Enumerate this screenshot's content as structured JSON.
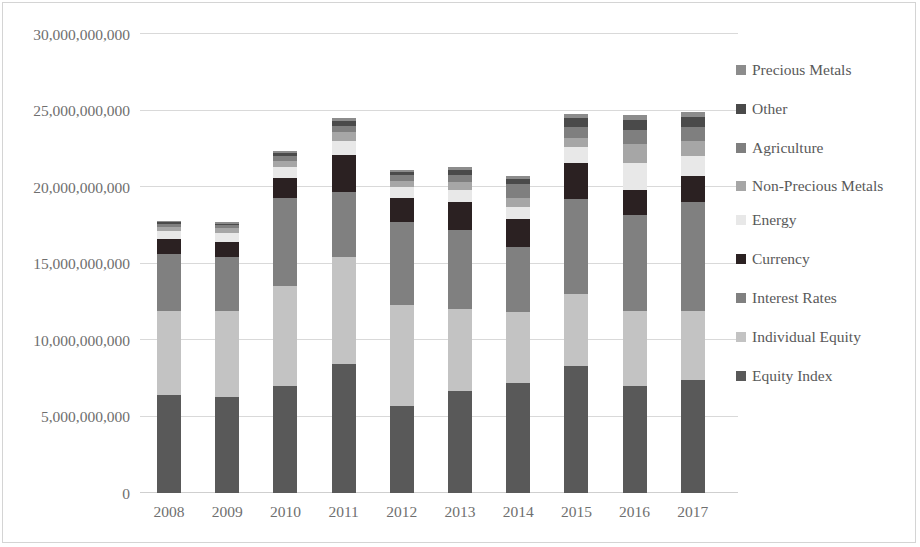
{
  "chart_data": {
    "type": "bar",
    "stacked": true,
    "title": "",
    "xlabel": "",
    "ylabel": "",
    "ylim": [
      0,
      30000000000
    ],
    "grid": true,
    "legend_position": "right",
    "categories": [
      "2008",
      "2009",
      "2010",
      "2011",
      "2012",
      "2013",
      "2014",
      "2015",
      "2016",
      "2017"
    ],
    "y_ticks": [
      0,
      5000000000,
      10000000000,
      15000000000,
      20000000000,
      25000000000,
      30000000000
    ],
    "y_tick_labels": [
      "0",
      "5,000,000,000",
      "10,000,000,000",
      "15,000,000,000",
      "20,000,000,000",
      "25,000,000,000",
      "30,000,000,000"
    ],
    "series": [
      {
        "name": "Equity Index",
        "color": "#595959",
        "values": [
          6400000000,
          6300000000,
          7000000000,
          8400000000,
          5700000000,
          6700000000,
          7200000000,
          8300000000,
          7000000000,
          7400000000
        ]
      },
      {
        "name": "Individual Equity",
        "color": "#c3c3c3",
        "values": [
          5500000000,
          5600000000,
          6500000000,
          7000000000,
          6600000000,
          5300000000,
          4600000000,
          4700000000,
          4900000000,
          4500000000
        ]
      },
      {
        "name": "Interest Rates",
        "color": "#808080",
        "values": [
          3700000000,
          3500000000,
          5800000000,
          4300000000,
          5400000000,
          5200000000,
          4300000000,
          6200000000,
          6300000000,
          7100000000
        ]
      },
      {
        "name": "Currency",
        "color": "#2b2122",
        "values": [
          1000000000,
          1000000000,
          1300000000,
          2400000000,
          1600000000,
          1800000000,
          1800000000,
          2400000000,
          1600000000,
          1700000000
        ]
      },
      {
        "name": "Energy",
        "color": "#e8e8e8",
        "values": [
          500000000,
          600000000,
          700000000,
          900000000,
          700000000,
          800000000,
          800000000,
          1000000000,
          1800000000,
          1300000000
        ]
      },
      {
        "name": "Non-Precious Metals",
        "color": "#a6a6a6",
        "values": [
          300000000,
          300000000,
          400000000,
          600000000,
          400000000,
          500000000,
          600000000,
          600000000,
          1200000000,
          1000000000
        ]
      },
      {
        "name": "Agriculture",
        "color": "#7f7f7f",
        "values": [
          200000000,
          200000000,
          300000000,
          400000000,
          400000000,
          500000000,
          900000000,
          700000000,
          900000000,
          900000000
        ]
      },
      {
        "name": "Other",
        "color": "#4a4a4a",
        "values": [
          100000000,
          100000000,
          200000000,
          300000000,
          200000000,
          300000000,
          300000000,
          600000000,
          700000000,
          700000000
        ]
      },
      {
        "name": "Precious Metals",
        "color": "#8c8c8c",
        "values": [
          100000000,
          100000000,
          150000000,
          200000000,
          150000000,
          200000000,
          200000000,
          250000000,
          300000000,
          300000000
        ]
      }
    ],
    "totals": [
      17800000000,
      17700000000,
      22350000000,
      24500000000,
      21150000000,
      21300000000,
      20700000000,
      24750000000,
      24700000000,
      24900000000
    ]
  },
  "legend": {
    "items": [
      {
        "label": "Precious Metals",
        "color": "#8c8c8c"
      },
      {
        "label": "Other",
        "color": "#4a4a4a"
      },
      {
        "label": "Agriculture",
        "color": "#7f7f7f"
      },
      {
        "label": "Non-Precious Metals",
        "color": "#a6a6a6"
      },
      {
        "label": "Energy",
        "color": "#e8e8e8"
      },
      {
        "label": "Currency",
        "color": "#2b2122"
      },
      {
        "label": "Interest Rates",
        "color": "#808080"
      },
      {
        "label": "Individual Equity",
        "color": "#c3c3c3"
      },
      {
        "label": "Equity Index",
        "color": "#595959"
      }
    ]
  }
}
